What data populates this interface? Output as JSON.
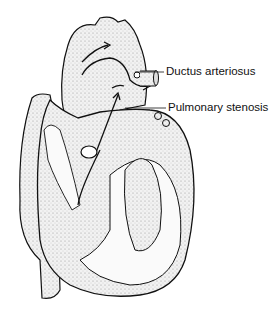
{
  "diagram": {
    "labels": [
      {
        "id": "ductus",
        "text": "Ductus arteriosus"
      },
      {
        "id": "pulmonary",
        "text": "Pulmonary stenosis"
      }
    ],
    "colors": {
      "ink": "#111111",
      "fill": "#e6e6e6",
      "background": "#ffffff"
    }
  }
}
